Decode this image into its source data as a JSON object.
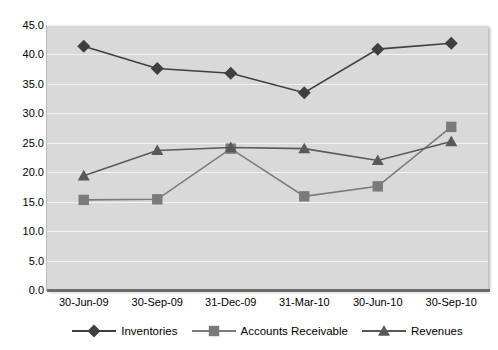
{
  "chart_data": {
    "type": "line",
    "title": "",
    "subtitle": "",
    "xlabel": "",
    "ylabel": "",
    "ylim": [
      0.0,
      45.0
    ],
    "ytick_step": 5.0,
    "grid": true,
    "legend_position": "bottom",
    "plot_background": "#d9d9d9",
    "gridline_color": "#f2f2f2",
    "categories": [
      "30-Jun-09",
      "30-Sep-09",
      "31-Dec-09",
      "31-Mar-10",
      "30-Jun-10",
      "30-Sep-10"
    ],
    "ytick_labels": [
      "45.0",
      "40.0",
      "35.0",
      "30.0",
      "25.0",
      "20.0",
      "15.0",
      "10.0",
      "5.0",
      "0.0"
    ],
    "ytick_values": [
      45.0,
      40.0,
      35.0,
      30.0,
      25.0,
      20.0,
      15.0,
      10.0,
      5.0,
      0.0
    ],
    "series": [
      {
        "name": "Inventories",
        "marker": "diamond",
        "color": "#3f3f3f",
        "values": [
          41.4,
          37.6,
          36.8,
          33.5,
          40.9,
          41.9
        ]
      },
      {
        "name": "Accounts Receivable",
        "marker": "square",
        "color": "#7a7a7a",
        "values": [
          15.3,
          15.4,
          24.0,
          15.9,
          17.6,
          27.7
        ]
      },
      {
        "name": "Revenues",
        "marker": "triangle",
        "color": "#595959",
        "values": [
          19.4,
          23.7,
          24.2,
          24.0,
          22.0,
          25.2
        ]
      }
    ]
  }
}
